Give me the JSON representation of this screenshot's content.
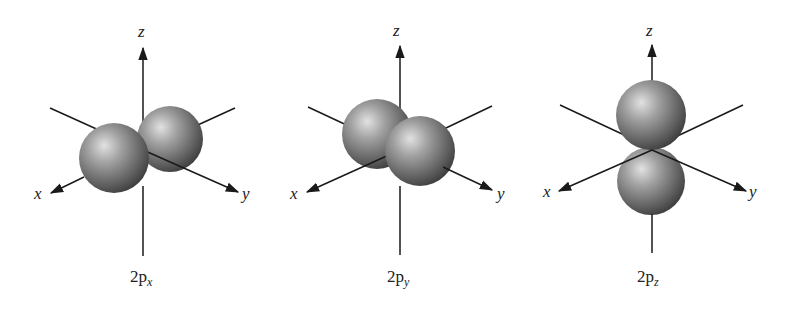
{
  "figure": {
    "panels": [
      {
        "id": "2px",
        "caption_main": "2p",
        "caption_sub": "x",
        "axis_labels": {
          "x": "x",
          "y": "y",
          "z": "z"
        },
        "lobe_orientation": "x"
      },
      {
        "id": "2py",
        "caption_main": "2p",
        "caption_sub": "y",
        "axis_labels": {
          "x": "x",
          "y": "y",
          "z": "z"
        },
        "lobe_orientation": "y"
      },
      {
        "id": "2pz",
        "caption_main": "2p",
        "caption_sub": "z",
        "axis_labels": {
          "x": "x",
          "y": "y",
          "z": "z"
        },
        "lobe_orientation": "z"
      }
    ],
    "colors": {
      "background": "#ffffff",
      "axis": "#1a1a1a",
      "lobe_highlight": "#d8d8d8",
      "lobe_mid": "#8a8a8a",
      "lobe_shadow": "#3a3a3a"
    }
  }
}
